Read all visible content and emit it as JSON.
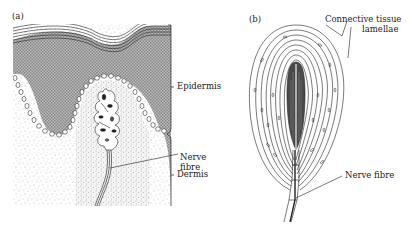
{
  "figure": {
    "panels": [
      {
        "id": "a",
        "tag": "(a)",
        "labels": {
          "epidermis": "Epidermis",
          "nerve_fibre_line1": "Nerve",
          "nerve_fibre_line2": "fibre",
          "dermis": "Dermis"
        }
      },
      {
        "id": "b",
        "tag": "(b)",
        "labels": {
          "connective_line1": "Connective tissue",
          "connective_line2": "lamellae",
          "nerve_fibre": "Nerve fibre"
        }
      }
    ],
    "colors": {
      "ink": "#222222",
      "epidermis_fill": "#a8a8a8",
      "background": "#ffffff"
    }
  }
}
